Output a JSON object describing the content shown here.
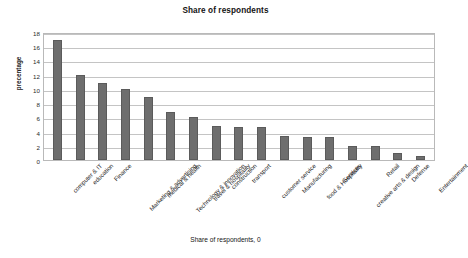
{
  "chart_data": {
    "type": "bar",
    "title": "Share of respondents",
    "xlabel": "Share of respondents, 0",
    "ylabel": "precentage",
    "ylim": [
      0,
      18
    ],
    "ytick_step": 2,
    "yticks": [
      18,
      16,
      14,
      12,
      10,
      8,
      6,
      4,
      2,
      0
    ],
    "grid": true,
    "legend": "none",
    "bar_color": "#6e6e6e",
    "categories": [
      "computer & IT",
      "education",
      "Finance",
      "Marketing & advertising",
      "medical & health",
      "Technology & innovation",
      "travel & hospitality",
      "construction",
      "transport",
      "customer service",
      "Manufacturing",
      "food & Hospitality",
      "Services",
      "creative arts  & design",
      "Retail",
      "Defense",
      "Entertainment"
    ],
    "values": [
      16.9,
      12,
      10.8,
      10,
      8.8,
      6.8,
      6,
      4.8,
      4.7,
      4.6,
      3.4,
      3.3,
      3.3,
      2,
      2,
      1,
      0.6
    ]
  }
}
